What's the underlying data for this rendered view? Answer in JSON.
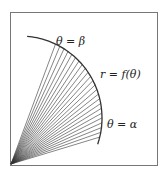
{
  "diagram": {
    "labels": {
      "theta_beta": "θ = β",
      "curve": "r = f(θ)",
      "theta_alpha": "θ = α"
    },
    "colors": {
      "stroke": "#333333",
      "border": "#555555",
      "background": "#ffffff"
    },
    "ray_count": 24
  }
}
